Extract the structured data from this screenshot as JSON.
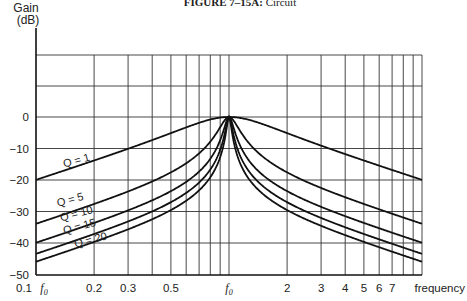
{
  "chart_data": {
    "type": "line",
    "title": "FIGURE 7–15A: Circuit",
    "title_bold_part": "FIGURE 7–15A:",
    "title_rest": " Circuit",
    "ylabel_line1": "Gain",
    "ylabel_line2": "(dB)",
    "xlabel": "frequency",
    "xscale": "log",
    "xlim": [
      0.1,
      10
    ],
    "ylim": [
      -50,
      20
    ],
    "grid": true,
    "yticks": [
      {
        "value": 0,
        "label": "0"
      },
      {
        "value": -10,
        "label": "−10"
      },
      {
        "value": -20,
        "label": "−20"
      },
      {
        "value": -30,
        "label": "−30"
      },
      {
        "value": -40,
        "label": "−40"
      },
      {
        "value": -50,
        "label": "−50"
      }
    ],
    "ygrid_values": [
      20,
      10,
      0,
      -10,
      -20,
      -30,
      -40
    ],
    "xgrid_values": [
      0.2,
      0.3,
      0.4,
      0.5,
      0.6,
      0.7,
      0.8,
      0.9,
      1,
      2,
      3,
      4,
      5,
      6,
      7,
      8,
      9,
      10
    ],
    "xticks": [
      {
        "value": 0.1,
        "label": "0.1"
      },
      {
        "value": 0.2,
        "label": "0.2"
      },
      {
        "value": 0.3,
        "label": "0.3"
      },
      {
        "value": 0.5,
        "label": "0.5"
      },
      {
        "value": 1,
        "label": "f0",
        "italic": true
      },
      {
        "value": 2,
        "label": "2"
      },
      {
        "value": 3,
        "label": "3"
      },
      {
        "value": 4,
        "label": "4"
      },
      {
        "value": 5,
        "label": "5"
      },
      {
        "value": 6,
        "label": "6"
      },
      {
        "value": 7,
        "label": "7"
      }
    ],
    "x_origin_label": "f0",
    "x_unit_note": "frequency in multiples of f0",
    "series": [
      {
        "name": "Q = 1",
        "Q": 1,
        "label": "Q = 1",
        "x": [
          0.1,
          0.2,
          0.3,
          0.5,
          0.7,
          1,
          2,
          3,
          5,
          10
        ],
        "y": [
          -20,
          -14.2,
          -10.7,
          -5.1,
          -1.3,
          0,
          -3.5,
          -8.7,
          -14.2,
          -20
        ]
      },
      {
        "name": "Q = 5",
        "Q": 5,
        "label": "Q = 5",
        "x": [
          0.1,
          0.2,
          0.3,
          0.5,
          0.7,
          1,
          2,
          3,
          5,
          10
        ],
        "y": [
          -33.9,
          -27.6,
          -23.9,
          -17.5,
          -10.9,
          0,
          -17.5,
          -23.9,
          -27.6,
          -33.9
        ]
      },
      {
        "name": "Q = 10",
        "Q": 10,
        "label": "Q = 10",
        "x": [
          0.1,
          0.2,
          0.3,
          0.5,
          0.7,
          1,
          2,
          3,
          5,
          10
        ],
        "y": [
          -39.9,
          -33.6,
          -29.9,
          -23.5,
          -16.8,
          0,
          -23.5,
          -29.9,
          -33.6,
          -39.9
        ]
      },
      {
        "name": "Q = 15",
        "Q": 15,
        "label": "Q = 15",
        "x": [
          0.1,
          0.2,
          0.3,
          0.5,
          0.7,
          1,
          2,
          3,
          5,
          10
        ],
        "y": [
          -43.5,
          -37.2,
          -33.5,
          -27.0,
          -20.3,
          0,
          -27.0,
          -33.5,
          -37.2,
          -43.5
        ]
      },
      {
        "name": "Q = 20",
        "Q": 20,
        "label": "Q = 20",
        "x": [
          0.1,
          0.2,
          0.3,
          0.5,
          0.7,
          1,
          2,
          3,
          5,
          10
        ],
        "y": [
          -46.0,
          -39.7,
          -36.0,
          -29.5,
          -22.8,
          0,
          -29.5,
          -36.0,
          -39.7,
          -46.0
        ]
      }
    ]
  }
}
